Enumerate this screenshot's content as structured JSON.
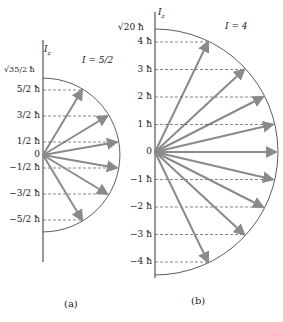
{
  "panel_a": {
    "caption": "(a)",
    "axis_label": "Iz",
    "quantum_label": "I = 5/2",
    "magnitude_label": "√35/2 ħ",
    "ticks": [
      "5/2 ħ",
      "3/2 ħ",
      "1/2 ħ",
      "0",
      "−1/2 ħ",
      "−3/2 ħ",
      "−5/2 ħ"
    ],
    "m_values": [
      2.5,
      1.5,
      0.5,
      -0.5,
      -1.5,
      -2.5
    ],
    "radius_units": 2.958
  },
  "panel_b": {
    "caption": "(b)",
    "axis_label": "Iz",
    "quantum_label": "I = 4",
    "magnitude_label": "√20 ħ",
    "ticks": [
      "4 ħ",
      "3 ħ",
      "2 ħ",
      "1 ħ",
      "0",
      "−1 ħ",
      "−2 ħ",
      "−3 ħ",
      "−4 ħ"
    ],
    "m_values": [
      4,
      3,
      2,
      1,
      0,
      -1,
      -2,
      -3,
      -4
    ],
    "radius_units": 4.472
  },
  "colors": {
    "arrow": "#8a8a8a",
    "line": "#333333",
    "dash": "#555555"
  }
}
